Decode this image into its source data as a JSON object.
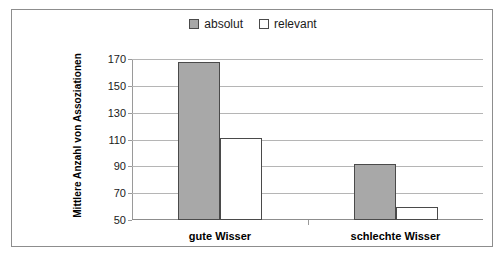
{
  "chart_data": {
    "type": "bar",
    "title": "",
    "xlabel": "",
    "ylabel": "Mittlere Anzahl von Assoziationen",
    "categories": [
      "gute Wisser",
      "schlechte Wisser"
    ],
    "series": [
      {
        "name": "absolut",
        "values": [
          168,
          92
        ],
        "color": "#a8a8a8",
        "style": "filled"
      },
      {
        "name": "relevant",
        "values": [
          111,
          60
        ],
        "color": "#ffffff",
        "style": "hollow"
      }
    ],
    "ylim": [
      50,
      170
    ],
    "yticks": [
      50,
      70,
      90,
      110,
      130,
      150,
      170
    ],
    "ytick_labels": [
      "50",
      "70",
      "90",
      "110",
      "130",
      "150",
      "170"
    ],
    "grid": true,
    "legend_position": "top-center"
  },
  "legend": {
    "entries": [
      {
        "label": "absolut",
        "swatch": "filled-gray-square-icon"
      },
      {
        "label": "relevant",
        "swatch": "hollow-white-square-icon"
      }
    ]
  },
  "caption": {
    "text": ""
  }
}
